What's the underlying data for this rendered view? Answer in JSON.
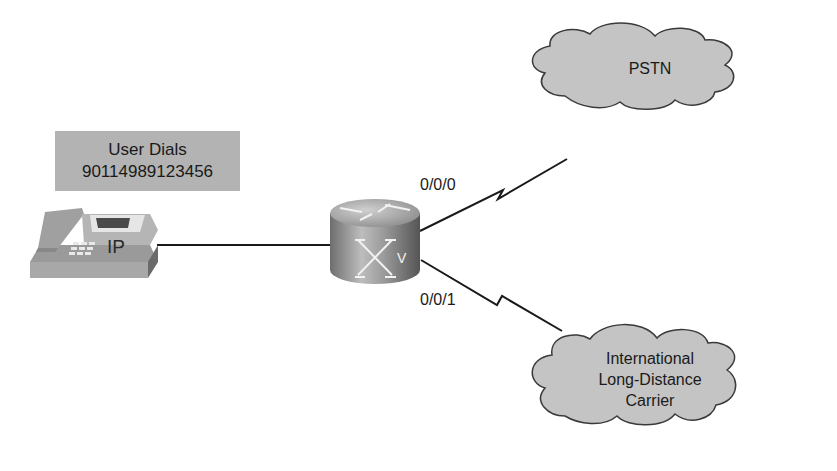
{
  "diagram": {
    "callout": {
      "line1": "User Dials",
      "line2": "90114989123456"
    },
    "phone": {
      "label": "IP",
      "icon": "ip-phone-icon"
    },
    "router": {
      "icon": "voice-router-icon",
      "badge": "V"
    },
    "links": {
      "port_top": "0/0/0",
      "port_bottom": "0/0/1"
    },
    "clouds": {
      "pstn": {
        "label": "PSTN"
      },
      "carrier": {
        "line1": "International",
        "line2": "Long-Distance",
        "line3": "Carrier"
      }
    },
    "colors": {
      "cloud_fill": "#c4c4c4",
      "callout_fill": "#b3b3b3",
      "line": "#1a1a1a"
    }
  }
}
